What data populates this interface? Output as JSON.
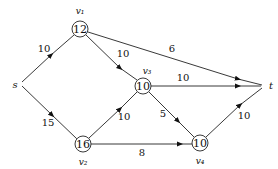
{
  "diagram": {
    "type": "flow-network",
    "nodes": [
      {
        "id": "s",
        "label": "s",
        "value": null,
        "x": 20,
        "y": 84
      },
      {
        "id": "v1",
        "label": "v₁",
        "value": "12",
        "x": 80,
        "y": 29
      },
      {
        "id": "v2",
        "label": "v₂",
        "value": "16",
        "x": 83,
        "y": 144
      },
      {
        "id": "v3",
        "label": "v₃",
        "value": "10",
        "x": 143,
        "y": 86
      },
      {
        "id": "v4",
        "label": "v₄",
        "value": "10",
        "x": 200,
        "y": 143
      },
      {
        "id": "t",
        "label": "t",
        "value": null,
        "x": 265,
        "y": 85
      }
    ],
    "edges": [
      {
        "from": "s",
        "to": "v1",
        "weight": "10"
      },
      {
        "from": "s",
        "to": "v2",
        "weight": "15"
      },
      {
        "from": "v1",
        "to": "v3",
        "weight": "10"
      },
      {
        "from": "v1",
        "to": "t",
        "weight": "6"
      },
      {
        "from": "v3",
        "to": "t",
        "weight": "10"
      },
      {
        "from": "v3",
        "to": "v4",
        "weight": "5"
      },
      {
        "from": "v2",
        "to": "v3",
        "weight": "10"
      },
      {
        "from": "v2",
        "to": "v4",
        "weight": "8"
      },
      {
        "from": "v4",
        "to": "t",
        "weight": "10"
      }
    ]
  }
}
